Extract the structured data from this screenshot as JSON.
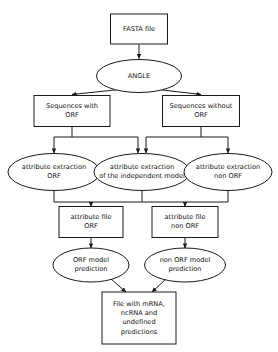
{
  "diagram": {
    "type": "flowchart",
    "canvas": {
      "width": 278,
      "height": 352
    },
    "style": {
      "background": "#ffffff",
      "stroke": "#1a1a1a",
      "fill": "#ffffff",
      "text": "#111111"
    },
    "nodes": [
      {
        "id": "fasta_file",
        "shape": "rect",
        "name": "node-fasta-file",
        "lines": [
          "FASTA file"
        ],
        "x": 139,
        "y": 29,
        "w": 57,
        "h": 30
      },
      {
        "id": "angle",
        "shape": "ellipse",
        "name": "node-angle",
        "lines": [
          "ANGLE"
        ],
        "x": 139,
        "y": 76,
        "w": 85,
        "h": 33
      },
      {
        "id": "sequences_with_orf",
        "shape": "rect",
        "name": "node-sequences-with-orf",
        "lines": [
          "Sequences with",
          "ORF"
        ],
        "x": 72,
        "y": 111,
        "w": 76,
        "h": 31
      },
      {
        "id": "sequences_without_orf",
        "shape": "rect",
        "name": "node-sequences-without-orf",
        "lines": [
          "Sequences without",
          "ORF"
        ],
        "x": 201,
        "y": 111,
        "w": 77,
        "h": 31
      },
      {
        "id": "attr_extraction_orf",
        "shape": "ellipse",
        "name": "node-attribute-extraction-orf",
        "lines": [
          "attribute extraction",
          "ORF"
        ],
        "x": 54,
        "y": 172,
        "w": 92,
        "h": 37
      },
      {
        "id": "attr_extraction_independent",
        "shape": "ellipse",
        "name": "node-attribute-extraction-independent-model",
        "lines": [
          "attribute extraction",
          "of the independent  model"
        ],
        "x": 142,
        "y": 172,
        "w": 96,
        "h": 37
      },
      {
        "id": "attr_extraction_non_orf",
        "shape": "ellipse",
        "name": "node-attribute-extraction-non-orf",
        "lines": [
          "attribute extraction",
          "non ORF"
        ],
        "x": 228,
        "y": 172,
        "w": 88,
        "h": 37
      },
      {
        "id": "attr_file_orf",
        "shape": "rect",
        "name": "node-attribute-file-orf",
        "lines": [
          "attribute file",
          "ORF"
        ],
        "x": 91,
        "y": 222,
        "w": 64,
        "h": 31
      },
      {
        "id": "attr_file_non_orf",
        "shape": "rect",
        "name": "node-attribute-file-non-orf",
        "lines": [
          "attribute file",
          "non ORF"
        ],
        "x": 185,
        "y": 222,
        "w": 66,
        "h": 31
      },
      {
        "id": "orf_model_prediction",
        "shape": "ellipse",
        "name": "node-orf-model-prediction",
        "lines": [
          "ORF model",
          "prediction"
        ],
        "x": 91,
        "y": 265,
        "w": 76,
        "h": 34
      },
      {
        "id": "non_orf_model_prediction",
        "shape": "ellipse",
        "name": "node-non-orf-model-prediction",
        "lines": [
          "non ORF model",
          "prediction"
        ],
        "x": 185,
        "y": 265,
        "w": 81,
        "h": 34
      },
      {
        "id": "result_file",
        "shape": "rect",
        "name": "node-result-file",
        "lines": [
          "File with mRNA,",
          "ncRNA and",
          "undefined",
          "predictions"
        ],
        "x": 139,
        "y": 318,
        "w": 74,
        "h": 52
      }
    ],
    "edges": [
      {
        "id": "e1",
        "name": "edge-fasta-to-angle",
        "from": "fasta_file",
        "to": "angle",
        "path": "M139,44.5 L139,58.5",
        "arrow": true
      },
      {
        "id": "e2",
        "name": "edge-angle-to-sequences-with-orf",
        "from": "angle",
        "to": "sequences_with_orf",
        "path": "M124,89 L72,94.5",
        "arrow": true
      },
      {
        "id": "e3",
        "name": "edge-angle-to-sequences-without-orf",
        "from": "angle",
        "to": "sequences_without_orf",
        "path": "M154,89 L201,94.5",
        "arrow": true
      },
      {
        "id": "e4",
        "name": "edge-with-orf-to-extraction-orf",
        "from": "sequences_with_orf",
        "to": "attr_extraction_orf",
        "path": "M72,126.5 L72,137 L54,137 L54,153",
        "arrow": true
      },
      {
        "id": "e5",
        "name": "edge-with-orf-to-extraction-independent",
        "from": "sequences_with_orf",
        "to": "attr_extraction_independent",
        "path": "M72,137 L138,137 L138,153",
        "arrow": true
      },
      {
        "id": "e6",
        "name": "edge-without-orf-to-extraction-independent",
        "from": "sequences_without_orf",
        "to": "attr_extraction_independent",
        "path": "M201,126.5 L201,137 L146,137 L146,153",
        "arrow": true
      },
      {
        "id": "e7",
        "name": "edge-without-orf-to-extraction-non-orf",
        "from": "sequences_without_orf",
        "to": "attr_extraction_non_orf",
        "path": "M201,137 L228,137 L228,153",
        "arrow": true
      },
      {
        "id": "e8",
        "name": "edge-extraction-orf-to-bus",
        "from": "attr_extraction_orf",
        "to": "bus",
        "path": "M54,190.5 L54,202",
        "arrow": false
      },
      {
        "id": "e9",
        "name": "edge-extraction-independent-to-bus",
        "from": "attr_extraction_independent",
        "to": "bus",
        "path": "M142,190.5 L142,202",
        "arrow": false
      },
      {
        "id": "e10",
        "name": "edge-extraction-non-orf-to-bus",
        "from": "attr_extraction_non_orf",
        "to": "bus",
        "path": "M228,190.5 L228,202",
        "arrow": false
      },
      {
        "id": "e11",
        "name": "edge-bus-horizontal",
        "from": "bus",
        "to": "bus",
        "path": "M54,202 L228,202",
        "arrow": false
      },
      {
        "id": "e12",
        "name": "edge-bus-to-attribute-file-orf",
        "from": "bus",
        "to": "attr_file_orf",
        "path": "M91,202 L91,206.5",
        "arrow": true
      },
      {
        "id": "e13",
        "name": "edge-bus-to-attribute-file-non-orf",
        "from": "bus",
        "to": "attr_file_non_orf",
        "path": "M185,202 L185,206.5",
        "arrow": true
      },
      {
        "id": "e14",
        "name": "edge-attribute-file-orf-to-prediction",
        "from": "attr_file_orf",
        "to": "orf_model_prediction",
        "path": "M91,237.5 L91,248",
        "arrow": true
      },
      {
        "id": "e15",
        "name": "edge-attribute-file-non-orf-to-prediction",
        "from": "attr_file_non_orf",
        "to": "non_orf_model_prediction",
        "path": "M185,237.5 L185,248",
        "arrow": true
      },
      {
        "id": "e16",
        "name": "edge-orf-prediction-to-result",
        "from": "orf_model_prediction",
        "to": "result_file",
        "path": "M111,279 L126,292",
        "arrow": true
      },
      {
        "id": "e17",
        "name": "edge-non-orf-prediction-to-result",
        "from": "non_orf_model_prediction",
        "to": "result_file",
        "path": "M166,279 L152,292",
        "arrow": true
      }
    ]
  }
}
